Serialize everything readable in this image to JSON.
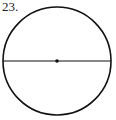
{
  "problem": {
    "number": "23."
  },
  "figure": {
    "shape": "circle",
    "center": [
      57,
      61
    ],
    "radius": 54,
    "diameter": "horizontal line through center",
    "center_point": "dot",
    "stroke_color": "#111111"
  }
}
